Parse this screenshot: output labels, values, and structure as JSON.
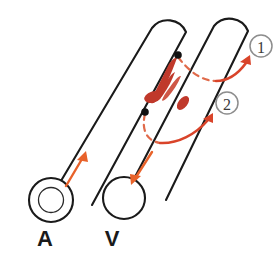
{
  "figure": {
    "background_color": "#ffffff"
  },
  "colors": {
    "vessel_stroke": "#1a1a1a",
    "vessel_fill": "#ffffff",
    "flow_arrow": "#E8622A",
    "route_arrow": "#D9442A",
    "dashed_arc": "#E06A4A",
    "lesion_red": "#C0392B",
    "lesion_red_light": "#CF5646",
    "callout_stroke": "#8d8d8d",
    "callout_text": "#3a3a3a",
    "dot_black": "#111111",
    "label_text": "#1a1a1a"
  },
  "vessels": [
    {
      "id": "artery",
      "label": "A",
      "label_x": 45,
      "label_y": 246,
      "has_inner_lumen": true,
      "flow_direction": "up-right"
    },
    {
      "id": "vein",
      "label": "V",
      "label_x": 112,
      "label_y": 246,
      "has_inner_lumen": false,
      "flow_direction": "down-left"
    }
  ],
  "callouts": [
    {
      "id": "callout-1",
      "label": "1",
      "cx": 261,
      "cy": 46,
      "r": 11
    },
    {
      "id": "callout-2",
      "label": "2",
      "cx": 227,
      "cy": 103,
      "r": 11
    }
  ],
  "markers": [
    {
      "id": "origin-dot-upper",
      "cx": 178,
      "cy": 55,
      "r": 3.6
    },
    {
      "id": "origin-dot-lower",
      "cx": 145,
      "cy": 112,
      "r": 3.6
    }
  ],
  "lesion": {
    "id": "thrombus-lesion",
    "description": "flame-shaped red lesion between vessels",
    "color": "#C0392B"
  },
  "routes": [
    {
      "id": "route-1",
      "from_marker": "origin-dot-upper",
      "to_callout": "callout-1"
    },
    {
      "id": "route-2",
      "from_marker": "origin-dot-lower",
      "to_callout": "callout-2"
    }
  ]
}
